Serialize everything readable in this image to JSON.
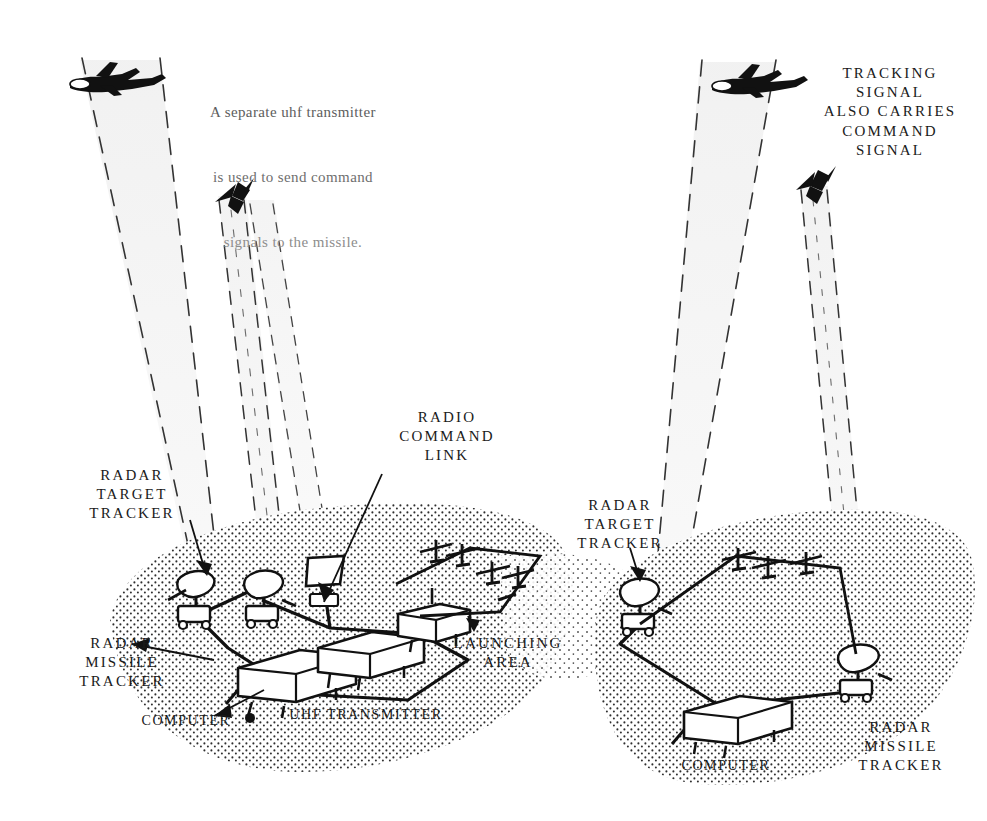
{
  "figure": {
    "ink_color": "#111111",
    "ground_stipple_color": "#3a3a3a",
    "paper_color": "#ffffff"
  },
  "note": {
    "line1": "A separate uhf transmitter",
    "line2": "is used to send command",
    "line3": "signals to the missile."
  },
  "left_panel": {
    "labels": {
      "radar_target_tracker": "RADAR\nTARGET\nTRACKER",
      "radio_command_link": "RADIO\nCOMMAND\nLINK",
      "radar_missile_tracker": "RADAR\nMISSILE\nTRACKER",
      "computer": "COMPUTER",
      "uhf_transmitter": "UHF TRANSMITTER",
      "launching_area": "LAUNCHING\nAREA"
    },
    "icons": {
      "aircraft": "bomber-aircraft-icon",
      "missile": "missile-icon",
      "target_tracker_dish": "radar-dish-icon",
      "missile_tracker_dish": "radar-dish-icon",
      "uhf_panel": "uhf-antenna-panel-icon",
      "computer_van": "computer-trailer-icon",
      "transmitter_van": "transmitter-trailer-icon",
      "launcher_rail": "missile-launcher-icon"
    }
  },
  "right_panel": {
    "labels": {
      "tracking_signal_note": "TRACKING\nSIGNAL\nALSO CARRIES\nCOMMAND\nSIGNAL",
      "radar_target_tracker": "RADAR\nTARGET\nTRACKER",
      "computer": "COMPUTER",
      "radar_missile_tracker": "RADAR\nMISSILE\nTRACKER"
    },
    "icons": {
      "aircraft": "bomber-aircraft-icon",
      "missile": "missile-icon",
      "target_tracker_dish": "radar-dish-icon",
      "missile_tracker_dish": "radar-dish-icon",
      "computer_van": "computer-trailer-icon",
      "launcher_rail": "missile-launcher-icon"
    }
  }
}
